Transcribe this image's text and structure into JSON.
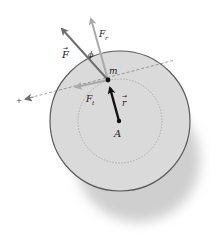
{
  "diagram": {
    "labels": {
      "force": "F",
      "radial_force": "F",
      "radial_sub": "r",
      "tangential_force": "F",
      "tangential_sub": "t",
      "angle": "ϕ",
      "mass": "m",
      "radius_vector": "r",
      "pivot": "A",
      "line_end_marker": "+"
    },
    "colors": {
      "disk_fill": "#d9d9d9",
      "disk_edge": "#555555",
      "shadow": "#c8c8c8",
      "force": "#6e6e6e",
      "components": "#a9a9a9",
      "radius_vector": "#111111",
      "dashed": "#777777"
    }
  }
}
